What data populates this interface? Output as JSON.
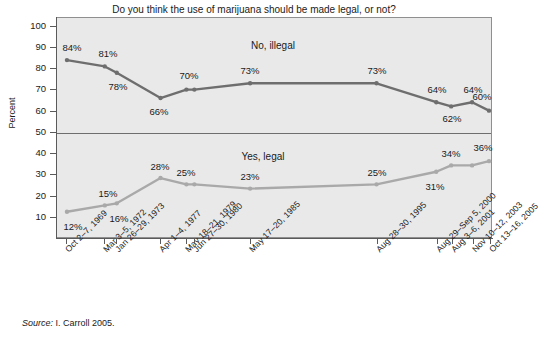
{
  "chart_data": {
    "type": "line",
    "title": "Do you think the use of marijuana should be made legal, or not?",
    "xlabel": "",
    "ylabel": "Percent",
    "ylim": [
      0,
      100
    ],
    "yticks": [
      10,
      20,
      30,
      40,
      50,
      60,
      70,
      80,
      90,
      100
    ],
    "grid": false,
    "legend_position": "inline-annotation",
    "reference_lines": [
      {
        "value": 50,
        "axis": "y"
      }
    ],
    "categories": [
      "Oct 2–7, 1969",
      "Mar 3–5, 1972",
      "Jan 26–29, 1973",
      "Apr 1–4, 1977",
      "May 18–21, 1979",
      "Jun 27–30, 1980",
      "May 17–20, 1985",
      "Aug 28–30, 1995",
      "Aug 29–Sep 5, 2000",
      "Aug 3–6, 2001",
      "Nov 10–12, 2003",
      "Oct 13–16, 2005"
    ],
    "x_positions": [
      66,
      104,
      116,
      160,
      186,
      194,
      250,
      377,
      437,
      452,
      473,
      490
    ],
    "series": [
      {
        "name": "No, illegal",
        "color": "#6e6e6e",
        "values": [
          84,
          81,
          78,
          66,
          70,
          70,
          73,
          73,
          64,
          62,
          64,
          60
        ],
        "labels": [
          "84%",
          "81%",
          "78%",
          "66%",
          "70%",
          "",
          "73%",
          "73%",
          "64%",
          "62%",
          "64%",
          "60%"
        ],
        "label_side": [
          "above",
          "above",
          "below",
          "below",
          "above",
          "",
          "above",
          "above",
          "above",
          "below",
          "above",
          "above"
        ],
        "annotation": "No, illegal"
      },
      {
        "name": "Yes, legal",
        "color": "#a9a9a9",
        "values": [
          12,
          15,
          16,
          28,
          25,
          25,
          23,
          25,
          31,
          34,
          34,
          36
        ],
        "labels": [
          "12%",
          "15%",
          "16%",
          "28%",
          "25%",
          "",
          "23%",
          "25%",
          "31%",
          "34%",
          "",
          "36%"
        ],
        "label_side": [
          "below",
          "above",
          "below",
          "above",
          "above",
          "",
          "above",
          "above",
          "below",
          "above",
          "",
          "above"
        ],
        "annotation": "Yes, legal"
      }
    ],
    "annotations": [
      {
        "text": "No, illegal",
        "x": 273,
        "y": 45
      },
      {
        "text": "Yes, legal",
        "x": 263,
        "y": 156
      }
    ]
  },
  "source": {
    "prefix": "Source:",
    "text": "I. Carroll 2005."
  }
}
